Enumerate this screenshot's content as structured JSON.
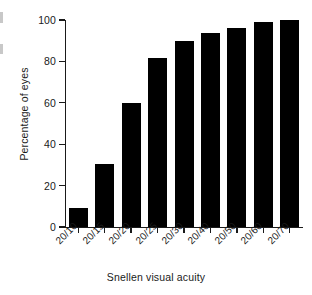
{
  "figure": {
    "background_color": "#ffffff",
    "bar_color": "#000000",
    "axis_color": "#1a1a1a"
  },
  "axes": {
    "x_title": "Snellen visual acuity",
    "y_title": "Percentage of eyes",
    "y_ticks": [
      "0",
      "20",
      "40",
      "60",
      "80",
      "100"
    ],
    "x_ticks": [
      "20/10",
      "20/15",
      "20/20",
      "20/25",
      "20/30",
      "20/40",
      "20/50",
      "20/60",
      "20/70"
    ]
  },
  "chart_data": {
    "type": "bar",
    "title": "",
    "subtitle": "",
    "xlabel": "Snellen visual acuity",
    "ylabel": "Percentage of eyes",
    "categories": [
      "20/10",
      "20/15",
      "20/20",
      "20/25",
      "20/30",
      "20/40",
      "20/50",
      "20/60",
      "20/70"
    ],
    "values": [
      9,
      30.5,
      60,
      81.5,
      90,
      93.5,
      96,
      99,
      100
    ],
    "series": [
      {
        "name": "Percentage of eyes",
        "values": [
          9,
          30.5,
          60,
          81.5,
          90,
          93.5,
          96,
          99,
          100
        ]
      }
    ],
    "ylim": [
      0,
      100
    ],
    "y_ticks": [
      0,
      20,
      40,
      60,
      80,
      100
    ],
    "grid": false,
    "legend": false,
    "legend_position": "none",
    "annotations": [],
    "bar_color": "#000000",
    "orientation": "vertical",
    "xtick_rotation": -45
  }
}
